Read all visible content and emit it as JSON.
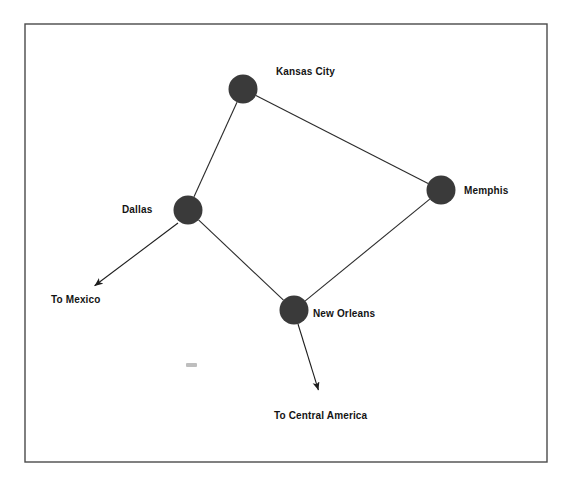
{
  "figure": {
    "type": "network-diagram",
    "background_color": "#ffffff",
    "frame": {
      "name": "figure-border",
      "x": 25,
      "y": 24,
      "width": 522,
      "height": 438,
      "stroke_color": "#4a4a4a",
      "stroke_width": 1.4
    },
    "node_style": {
      "fill_color": "#3a3a3a",
      "radius": 14.5
    },
    "edge_style": {
      "stroke_color": "#2b2b2b",
      "stroke_width": 1.1
    }
  },
  "nodes": [
    {
      "id": "kansas_city",
      "label": "Kansas City",
      "cx": 243,
      "cy": 89,
      "label_x": 276,
      "label_y": 66
    },
    {
      "id": "memphis",
      "label": "Memphis",
      "cx": 441,
      "cy": 190,
      "label_x": 464,
      "label_y": 185
    },
    {
      "id": "dallas",
      "label": "Dallas",
      "cx": 188,
      "cy": 210,
      "label_x": 122,
      "label_y": 204
    },
    {
      "id": "new_orleans",
      "label": "New Orleans",
      "cx": 294,
      "cy": 310,
      "label_x": 313,
      "label_y": 308
    }
  ],
  "edges": [
    {
      "id": "kc-dallas",
      "from": "kansas_city",
      "to": "dallas"
    },
    {
      "id": "kc-memphis",
      "from": "kansas_city",
      "to": "memphis"
    },
    {
      "id": "memphis-new-orleans",
      "from": "memphis",
      "to": "new_orleans"
    },
    {
      "id": "dallas-new-orleans",
      "from": "dallas",
      "to": "new_orleans"
    }
  ],
  "external_flows": [
    {
      "id": "to_mexico",
      "label": "To Mexico",
      "from": "dallas",
      "x1": 178,
      "y1": 223,
      "x2": 93,
      "y2": 287,
      "label_x": 51,
      "label_y": 294
    },
    {
      "id": "to_central_america",
      "label": "To Central America",
      "from": "new_orleans",
      "x1": 298,
      "y1": 324,
      "x2": 319,
      "y2": 392,
      "label_x": 274,
      "label_y": 410
    }
  ],
  "artifact": {
    "id": "scan-smudge",
    "description": "faint illegible scan smudge"
  }
}
